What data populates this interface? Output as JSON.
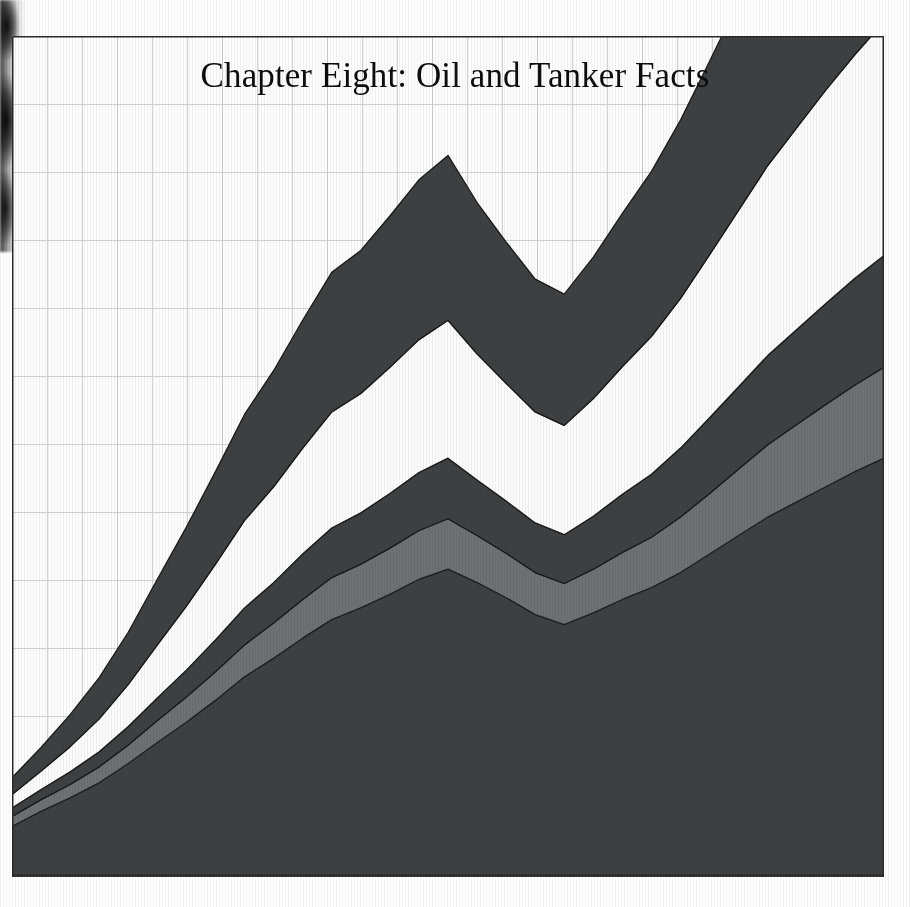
{
  "page": {
    "background_color": "#ffffff",
    "plate_background_color": "#fdfdfd",
    "edge_shadow": "page-edge-shadow"
  },
  "title": {
    "text": "Chapter Eight: Oil and Tanker Facts",
    "color": "#0d0d0d"
  },
  "colors": {
    "band_dark": "#3f4042",
    "band_mid": "#6e7173",
    "band_white": "#fbfbfb",
    "band_outline": "#1a1a1a",
    "grid_line": "#d2d2d2",
    "axis_line": "#2a2a2a",
    "plate_fill": "#fdfdfd"
  },
  "grid": {
    "visible": true,
    "vertical_spacing_px": 35,
    "horizontal_spacing_px": 68,
    "vertical_count": 25,
    "horizontal_count": 12,
    "border": true
  },
  "chart_data": {
    "type": "area",
    "title": "Chapter Eight: Oil and Tanker Facts",
    "subtitle": "",
    "xlabel": "",
    "ylabel": "",
    "stacked": true,
    "legend_position": "none",
    "grid": true,
    "xlim": [
      0,
      30
    ],
    "ylim": [
      0,
      100
    ],
    "x": [
      0,
      1,
      2,
      3,
      4,
      5,
      6,
      7,
      8,
      9,
      10,
      11,
      12,
      13,
      14,
      15,
      16,
      17,
      18,
      19,
      20,
      21,
      22,
      23,
      24,
      25,
      26,
      27,
      28,
      29,
      30
    ],
    "categories": [
      "0",
      "1",
      "2",
      "3",
      "4",
      "5",
      "6",
      "7",
      "8",
      "9",
      "10",
      "11",
      "12",
      "13",
      "14",
      "15",
      "16",
      "17",
      "18",
      "19",
      "20",
      "21",
      "22",
      "23",
      "24",
      "25",
      "26",
      "27",
      "28",
      "29",
      "30"
    ],
    "series": [
      {
        "name": "Series 1",
        "color": "#3f4042",
        "values": [
          6.0,
          7.8,
          9.4,
          11.2,
          13.5,
          16.0,
          18.4,
          21.0,
          23.8,
          26.0,
          28.4,
          30.6,
          32.0,
          33.6,
          35.4,
          36.6,
          35.0,
          33.2,
          31.2,
          30.0,
          31.4,
          33.0,
          34.4,
          36.2,
          38.4,
          40.6,
          42.8,
          44.6,
          46.4,
          48.2,
          49.8
        ]
      },
      {
        "name": "Series 2",
        "color": "#6e7173",
        "values": [
          1.2,
          1.4,
          1.6,
          1.9,
          2.2,
          2.6,
          3.0,
          3.4,
          3.8,
          4.2,
          4.6,
          5.0,
          5.2,
          5.5,
          5.8,
          6.0,
          5.6,
          5.3,
          5.0,
          4.9,
          5.2,
          5.6,
          6.0,
          6.6,
          7.2,
          7.9,
          8.6,
          9.2,
          9.8,
          10.3,
          10.8
        ]
      },
      {
        "name": "Series 3",
        "color": "#3f4042",
        "values": [
          1.0,
          1.2,
          1.5,
          1.8,
          2.2,
          2.7,
          3.2,
          3.8,
          4.4,
          4.8,
          5.4,
          5.9,
          6.1,
          6.5,
          6.9,
          7.2,
          6.6,
          6.2,
          5.9,
          5.8,
          6.3,
          6.9,
          7.5,
          8.2,
          9.0,
          9.8,
          10.6,
          11.3,
          12.0,
          12.7,
          13.3
        ]
      },
      {
        "name": "Series 4",
        "color": "#fbfbfb",
        "values": [
          1.6,
          2.2,
          3.0,
          3.9,
          5.0,
          6.3,
          7.6,
          9.0,
          10.4,
          11.4,
          12.6,
          13.8,
          14.2,
          15.0,
          15.8,
          16.4,
          15.0,
          14.0,
          13.2,
          13.0,
          14.0,
          15.2,
          16.4,
          17.8,
          19.4,
          21.0,
          22.6,
          24.0,
          25.4,
          26.6,
          27.8
        ]
      },
      {
        "name": "Series 5",
        "color": "#3f4042",
        "values": [
          2.0,
          2.8,
          3.8,
          4.9,
          6.2,
          7.8,
          9.4,
          11.0,
          12.6,
          13.8,
          15.2,
          16.6,
          17.0,
          18.0,
          19.0,
          19.6,
          18.0,
          16.8,
          15.8,
          15.6,
          16.8,
          18.2,
          19.6,
          21.2,
          23.0,
          24.8,
          26.6,
          28.2,
          29.8,
          31.2,
          32.6
        ]
      }
    ]
  }
}
